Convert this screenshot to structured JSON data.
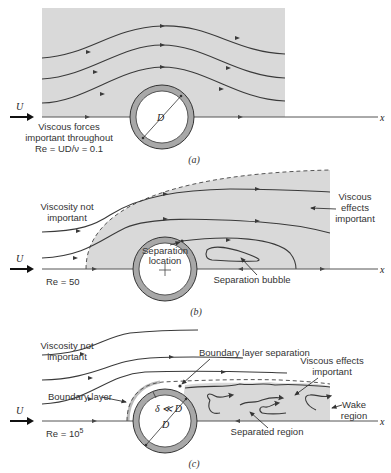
{
  "colors": {
    "viscous_region": "#d9d9d9",
    "cylinder_ring": "#a8a8a8",
    "streamline": "#3a3a3a",
    "text": "#333333"
  },
  "common": {
    "velocity_symbol": "U",
    "x_axis_label": "x",
    "diameter_label": "D"
  },
  "panel_a": {
    "caption": "(a)",
    "label_line1": "Viscous forces",
    "label_line2": "important throughout",
    "reynolds": "Re = UD/ν = 0.1"
  },
  "panel_b": {
    "caption": "(b)",
    "outer_label_line1": "Viscosity not",
    "outer_label_line2": "important",
    "viscous_label_line1": "Viscous",
    "viscous_label_line2": "effects",
    "viscous_label_line3": "important",
    "separation_line1": "Separation",
    "separation_line2": "location",
    "bubble_label": "Separation bubble",
    "reynolds": "Re = 50"
  },
  "panel_c": {
    "caption": "(c)",
    "outer_label_line1": "Viscosity not",
    "outer_label_line2": "important",
    "bl_separation_label": "Boundary layer separation",
    "viscous_label_line1": "Viscous effects",
    "viscous_label_line2": "important",
    "boundary_layer_label": "Boundary layer",
    "delta_label": "δ ≪ D",
    "wake_line1": "Wake",
    "wake_line2": "region",
    "separated_label": "Separated region",
    "reynolds_base": "Re = 10",
    "reynolds_exp": "5"
  }
}
